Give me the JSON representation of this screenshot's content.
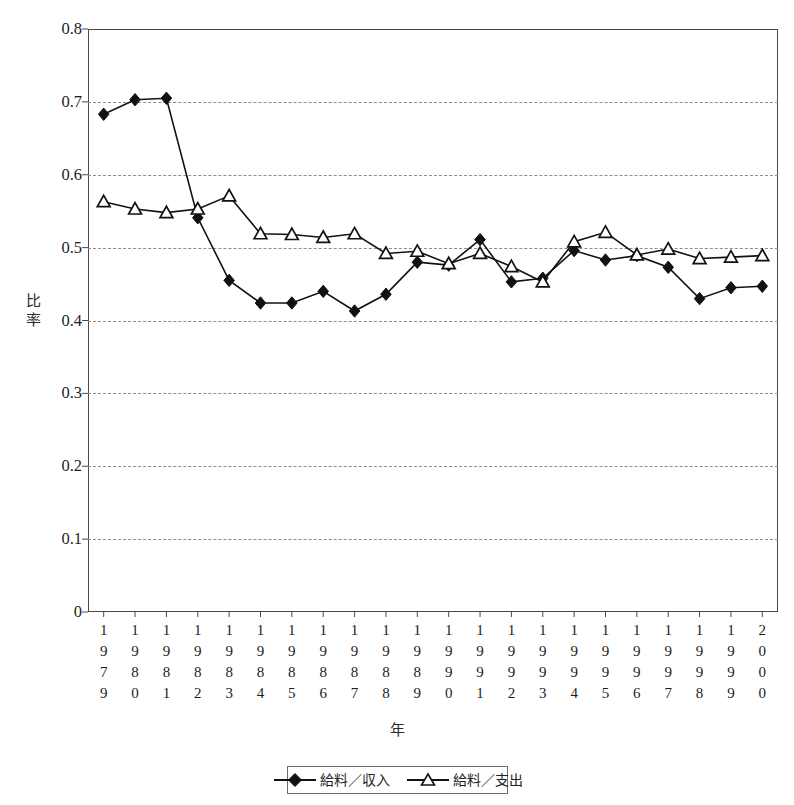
{
  "chart_data": {
    "type": "line",
    "title": "",
    "xlabel": "年",
    "ylabel": "比率",
    "ylim": [
      0,
      0.8
    ],
    "yticks": [
      "0",
      "0.1",
      "0.2",
      "0.3",
      "0.4",
      "0.5",
      "0.6",
      "0.7",
      "0.8"
    ],
    "ytick_values": [
      0,
      0.1,
      0.2,
      0.3,
      0.4,
      0.5,
      0.6,
      0.7,
      0.8
    ],
    "grid": "horizontal-dashed",
    "legend_position": "bottom-center",
    "categories": [
      "1979",
      "1980",
      "1981",
      "1982",
      "1983",
      "1984",
      "1985",
      "1986",
      "1987",
      "1988",
      "1989",
      "1990",
      "1991",
      "1992",
      "1993",
      "1994",
      "1995",
      "1996",
      "1997",
      "1998",
      "1999",
      "2000"
    ],
    "series": [
      {
        "name": "給料／収入",
        "marker": "filled-diamond",
        "color": "#111111",
        "values": [
          0.683,
          0.703,
          0.705,
          0.541,
          0.455,
          0.424,
          0.424,
          0.44,
          0.413,
          0.436,
          0.48,
          0.476,
          0.511,
          0.453,
          0.458,
          0.496,
          0.483,
          0.489,
          0.473,
          0.43,
          0.445,
          0.447
        ]
      },
      {
        "name": "給料／支出",
        "marker": "open-triangle",
        "color": "#111111",
        "values": [
          0.563,
          0.553,
          0.548,
          0.553,
          0.571,
          0.519,
          0.518,
          0.514,
          0.519,
          0.492,
          0.495,
          0.478,
          0.492,
          0.474,
          0.453,
          0.508,
          0.521,
          0.49,
          0.498,
          0.485,
          0.487,
          0.489
        ]
      }
    ]
  },
  "axis": {
    "y_title": "比率",
    "y_title_chars": [
      "比",
      "率"
    ],
    "x_title": "年"
  },
  "legend": {
    "items": [
      {
        "label": "給料／収入",
        "marker": "filled-diamond"
      },
      {
        "label": "給料／支出",
        "marker": "open-triangle"
      }
    ]
  }
}
